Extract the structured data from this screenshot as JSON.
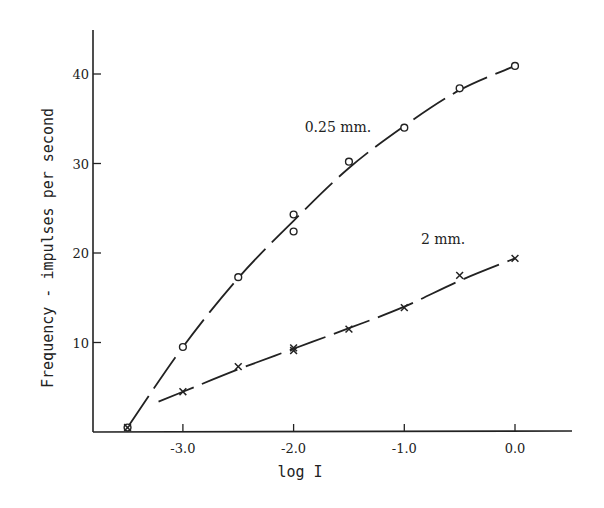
{
  "chart_data": {
    "type": "line",
    "title": "",
    "xlabel": "log I",
    "ylabel": "Frequency - impulses per second",
    "xlim": [
      -3.85,
      0.5
    ],
    "ylim": [
      0,
      45
    ],
    "xticks": [
      -3.0,
      -2.0,
      -1.0,
      0.0
    ],
    "xtick_labels": [
      "-3.0",
      "-2.0",
      "-1.0",
      "0.0"
    ],
    "yticks": [
      10,
      20,
      30,
      40
    ],
    "ytick_labels": [
      "10",
      "20",
      "30",
      "40"
    ],
    "grid": false,
    "legend": "inline labels",
    "series": [
      {
        "name": "0.25 mm.",
        "marker": "circle",
        "x": [
          -3.5,
          -3.0,
          -2.5,
          -2.0,
          -2.0,
          -1.5,
          -1.0,
          -0.5,
          0.0
        ],
        "y": [
          0.5,
          9.5,
          17.3,
          24.3,
          22.4,
          30.2,
          34.0,
          38.4,
          40.9
        ],
        "curve": [
          [
            -3.5,
            0.5
          ],
          [
            -3.0,
            9.5
          ],
          [
            -2.5,
            17.2
          ],
          [
            -2.0,
            23.6
          ],
          [
            -1.5,
            29.5
          ],
          [
            -1.0,
            34.2
          ],
          [
            -0.5,
            38.2
          ],
          [
            0.0,
            40.9
          ]
        ],
        "label_pos": [
          -1.9,
          33.5
        ]
      },
      {
        "name": "2 mm.",
        "marker": "cross",
        "x": [
          -3.5,
          -3.0,
          -2.5,
          -2.0,
          -2.0,
          -1.5,
          -1.0,
          -0.5,
          0.0
        ],
        "y": [
          0.5,
          4.5,
          7.3,
          9.4,
          9.1,
          11.5,
          13.9,
          17.5,
          19.4
        ],
        "curve": [
          [
            -3.22,
            3.4
          ],
          [
            -3.0,
            4.5
          ],
          [
            -2.5,
            7.0
          ],
          [
            -2.0,
            9.3
          ],
          [
            -1.5,
            11.6
          ],
          [
            -1.0,
            14.0
          ],
          [
            -0.5,
            16.9
          ],
          [
            0.0,
            19.4
          ]
        ],
        "label_pos": [
          -0.85,
          21.0
        ]
      }
    ]
  }
}
